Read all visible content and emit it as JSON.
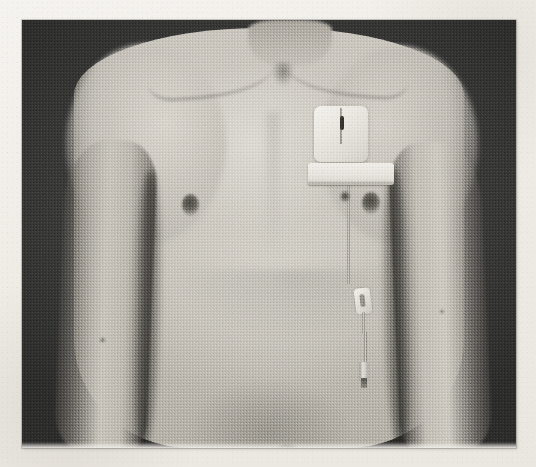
{
  "document": {
    "medium": "scanned printed photograph on off-white page",
    "page_background_color": "#efece7",
    "photo_border_color": "#7a7872"
  },
  "photograph": {
    "type": "clinical photograph",
    "color_mode": "black and white / grayscale",
    "grain": "visible halftone print grain",
    "frame": {
      "x": 22,
      "y": 20,
      "width": 494,
      "height": 428
    },
    "backdrop_color": "#3b3b3b",
    "skin_tone_color": "#c7c3ba",
    "subject": "anterior torso of a thin patient, head cropped above, arms hanging at the sides",
    "view": "frontal chest and upper abdomen"
  },
  "anatomy": [
    {
      "name": "neck",
      "note": "cropped at top edge"
    },
    {
      "name": "left-clavicle",
      "note": "prominent"
    },
    {
      "name": "right-clavicle",
      "note": "prominent"
    },
    {
      "name": "sternal-notch",
      "note": "visible depression"
    },
    {
      "name": "left-nipple",
      "x": 168,
      "y": 185
    },
    {
      "name": "right-nipple",
      "x": 349,
      "y": 183
    },
    {
      "name": "umbilicus",
      "x": 265,
      "y": 432
    },
    {
      "name": "left-arm",
      "note": "at side, shadowed axillary cleft"
    },
    {
      "name": "right-arm",
      "note": "at side, shadowed axillary cleft"
    }
  ],
  "medical_device": {
    "name": "tunnelled central venous catheter",
    "components": [
      {
        "label": "gauze dressing pad",
        "shape": "square white pad",
        "x": 292,
        "y": 86,
        "width": 54,
        "height": 56
      },
      {
        "label": "exit site mark",
        "note": "dark vertical mark on pad"
      },
      {
        "label": "adhesive tape strip",
        "shape": "horizontal white strip",
        "x": 286,
        "y": 143,
        "width": 86,
        "height": 22
      },
      {
        "label": "catheter tubing",
        "note": "pale line running down the chest"
      },
      {
        "label": "roller clamp",
        "x": 333,
        "y": 268,
        "width": 16,
        "height": 26
      },
      {
        "label": "connector hub",
        "x": 337,
        "y": 342,
        "width": 10,
        "height": 20
      },
      {
        "label": "anchoring suture",
        "note": "small dark knot above the tape"
      }
    ]
  },
  "marks": [
    {
      "name": "skin-mark-upper-left-arm",
      "x": 78,
      "y": 318,
      "size": 4
    },
    {
      "name": "skin-mark-right-arm",
      "x": 418,
      "y": 290,
      "size": 3
    },
    {
      "name": "skin-mark-right-chest",
      "x": 318,
      "y": 182,
      "size": 5
    }
  ]
}
